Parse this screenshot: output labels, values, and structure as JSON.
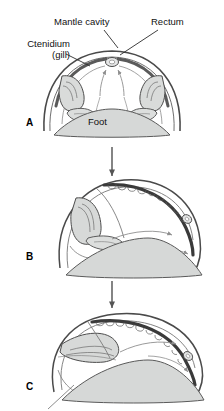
{
  "figure": {
    "type": "biological-diagram",
    "background_color": "#ffffff",
    "line_color": "#3a3a3a",
    "shell_band_color": "#4a4a4a",
    "tissue_fill": "#d6d8d7",
    "arrow_color": "#8a8a8a",
    "text_color": "#111111"
  },
  "labels": {
    "mantle_cavity": "Mantle cavity",
    "rectum": "Rectum",
    "ctenidium_line1": "Ctenidium",
    "ctenidium_line2": "(gill)",
    "foot": "Foot"
  },
  "panels": [
    {
      "id": "A",
      "label": "A",
      "caption": "Untorted larva: mantle cavity posterior, bilateral ctenidia, rectum at apex",
      "symmetry": "bilateral",
      "structures": [
        "shell",
        "mantle cavity",
        "left ctenidium",
        "right ctenidium",
        "rectum",
        "foot"
      ],
      "water_flow": "two arrows entering posteriorly and converging upward toward rectum"
    },
    {
      "id": "B",
      "label": "B",
      "caption": "Partial torsion, 90 degrees: visceral mass rotating counterclockwise",
      "symmetry": "asymmetric",
      "structures": [
        "shell",
        "mantle cavity",
        "ctenidium",
        "rectum",
        "foot"
      ],
      "water_flow": "curved arrows sweeping to the right along the mantle"
    },
    {
      "id": "C",
      "label": "C",
      "caption": "Full torsion, 180 degrees: mantle cavity and ctenidium now anterior",
      "symmetry": "asymmetric",
      "structures": [
        "shell",
        "mantle cavity",
        "ctenidium",
        "rectum",
        "foot"
      ],
      "water_flow": "curved arrows sweeping to the right and downward"
    }
  ],
  "transition_arrows": [
    {
      "from": "A",
      "to": "B",
      "direction": "down"
    },
    {
      "from": "B",
      "to": "C",
      "direction": "down"
    }
  ],
  "leader_lines": [
    {
      "label": "Mantle cavity",
      "points_to": "mantle cavity in panel A"
    },
    {
      "label": "Rectum",
      "points_to": "rectum at apex in panel A"
    },
    {
      "label": "Ctenidium (gill)",
      "points_to": "left ctenidium in panel A"
    }
  ]
}
